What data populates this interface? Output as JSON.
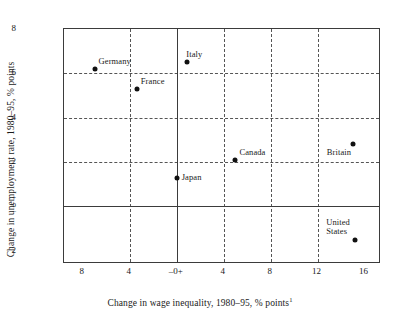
{
  "chart_data": {
    "type": "scatter",
    "title": "",
    "xlabel": "Change in wage inequality, 1980–95, % points",
    "xlabel_footnote": "1",
    "ylabel": "Change in unemployment rate, 1980–95, % points",
    "xlim": [
      -9.6,
      17.4
    ],
    "ylim": [
      -2.6,
      8.0
    ],
    "xticks": [
      -8,
      -4,
      0,
      4,
      8,
      12,
      16
    ],
    "xticklabels": [
      "8",
      "4",
      "–0+",
      "4",
      "8",
      "12",
      "16"
    ],
    "yticks": [
      8,
      6,
      4,
      2,
      0,
      -2
    ],
    "yticklabels": [
      "8",
      "6",
      "4",
      "2",
      "0",
      "2"
    ],
    "y_zero_marker": {
      "plus": "+",
      "zero": "0",
      "minus": "–"
    },
    "grid": "dashed",
    "grid_x": [
      -4,
      4,
      8,
      12
    ],
    "grid_y": [
      6,
      4,
      2
    ],
    "zero_axis_x": 0,
    "zero_axis_y": 0,
    "legend": "none",
    "marker_color": "#111111",
    "frame_color": "#3b3b3b",
    "points": [
      {
        "label": "Germany",
        "x": -7.0,
        "y": 6.2,
        "label_pos": "above-right"
      },
      {
        "label": "France",
        "x": -3.4,
        "y": 5.3,
        "label_pos": "above-right"
      },
      {
        "label": "Italy",
        "x": 0.9,
        "y": 6.5,
        "label_pos": "above"
      },
      {
        "label": "Japan",
        "x": 0.0,
        "y": 1.3,
        "label_pos": "right"
      },
      {
        "label": "Canada",
        "x": 5.0,
        "y": 2.1,
        "label_pos": "above-right"
      },
      {
        "label": "Britain",
        "x": 15.0,
        "y": 2.8,
        "label_pos": "below-left"
      },
      {
        "label": "United\nStates",
        "x": 15.2,
        "y": -1.5,
        "label_pos": "above-left"
      }
    ]
  }
}
